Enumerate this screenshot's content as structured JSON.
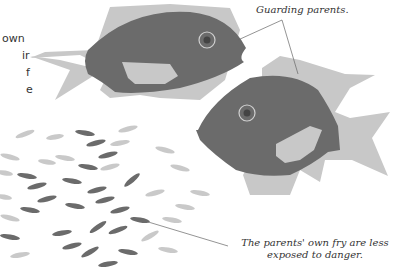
{
  "side_text": {
    "lines": [
      "own",
      "ir",
      "f",
      "e"
    ]
  },
  "labels": {
    "guarding": "Guarding parents.",
    "fry_line1": "The parents' own fry are less",
    "fry_line2": "exposed to danger."
  },
  "colors": {
    "parent_body": "#6b6b6b",
    "parent_fins": "#c8c8c8",
    "own_fry": "#6b6b6b",
    "other_fry": "#c4c4c4",
    "eye_ring": "#d0d0d0",
    "leader_line": "#666666"
  }
}
